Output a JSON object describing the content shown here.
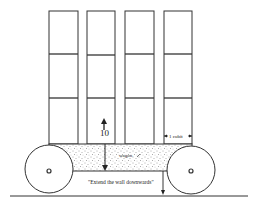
{
  "diagram": {
    "type": "wall-on-wagon illustration",
    "columns": 4,
    "rows_per_column": 3,
    "labels": {
      "height_value": "10",
      "width_label": "1 cubit",
      "wagon_label": "wagon",
      "caption": "\"Extend the wall downwards\""
    },
    "colors": {
      "line": "#333333",
      "background": "#ffffff",
      "stipple": "#555555"
    }
  }
}
